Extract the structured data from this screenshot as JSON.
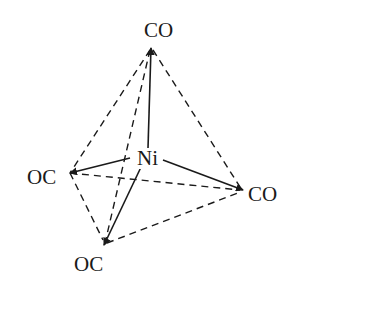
{
  "diagram": {
    "center": {
      "label": "Ni"
    },
    "ligands": [
      {
        "label": "CO",
        "position": "top"
      },
      {
        "label": "OC",
        "position": "left"
      },
      {
        "label": "CO",
        "position": "right"
      },
      {
        "label": "OC",
        "position": "bottom"
      }
    ],
    "colors": {
      "line": "#1a1a1a",
      "background": "#ffffff"
    }
  }
}
